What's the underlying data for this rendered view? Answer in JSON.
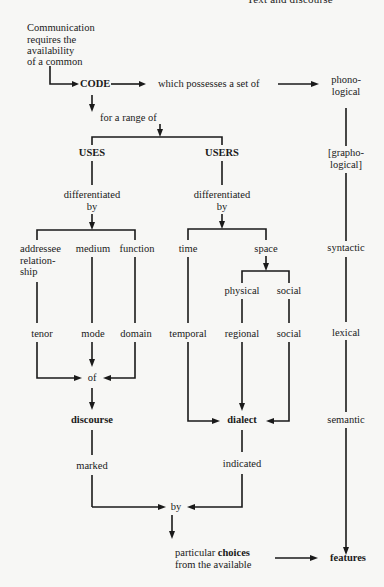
{
  "header": {
    "running_title": "Text and discourse"
  },
  "diagram": {
    "intro": [
      "Communication",
      "requires the",
      "availability",
      "of a common"
    ],
    "code": "CODE",
    "code_relation": "which possesses a set of",
    "range": "for a range of",
    "uses": "USES",
    "users": "USERS",
    "differentiated_by_uses": [
      "differentiated",
      "by"
    ],
    "differentiated_by_users": [
      "differentiated",
      "by"
    ],
    "uses_dimensions": {
      "addressee": [
        "addressee",
        "relation-",
        "ship"
      ],
      "medium": "medium",
      "function": "function"
    },
    "users_dimensions": {
      "time": "time",
      "space": "space",
      "physical": "physical",
      "social": "social"
    },
    "register_terms": {
      "tenor": "tenor",
      "mode": "mode",
      "domain": "domain"
    },
    "dialect_terms": {
      "temporal": "temporal",
      "regional": "regional",
      "social": "social"
    },
    "of": "of",
    "discourse": "discourse",
    "dialect": "dialect",
    "marked": "marked",
    "indicated": "indicated",
    "by": "by",
    "choices": {
      "prefix": "particular ",
      "bold": "choices",
      "line2": "from the available"
    },
    "features": "features",
    "levels": {
      "phonological": [
        "phono-",
        "logical"
      ],
      "graphological": [
        "[grapho-",
        "logical]"
      ],
      "syntactic": "syntactic",
      "lexical": "lexical",
      "semantic": "semantic"
    }
  }
}
